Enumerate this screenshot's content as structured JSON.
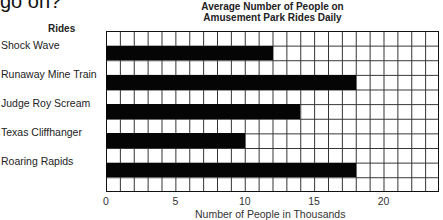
{
  "page": {
    "question_fragment": "go on?"
  },
  "chart_data": {
    "type": "bar",
    "orientation": "horizontal",
    "title": "Average Number of People on Amusement Park Rides Daily",
    "title_lines": [
      "Average Number of People on",
      "Amusement Park Rides Daily"
    ],
    "category_header": "Rides",
    "categories": [
      "Shock Wave",
      "Runaway Mine Train",
      "Judge Roy Scream",
      "Texas Cliffhanger",
      "Roaring Rapids"
    ],
    "values": [
      12,
      18,
      14,
      10,
      18
    ],
    "xlabel": "Number of People in Thousands",
    "ylabel": "Rides",
    "xlim": [
      0,
      24
    ],
    "x_ticks": [
      "0",
      "5",
      "10",
      "15",
      "20"
    ],
    "x_tick_values": [
      0,
      5,
      10,
      15,
      20
    ],
    "grid": true,
    "legend": null,
    "bar_color": "#050505"
  }
}
